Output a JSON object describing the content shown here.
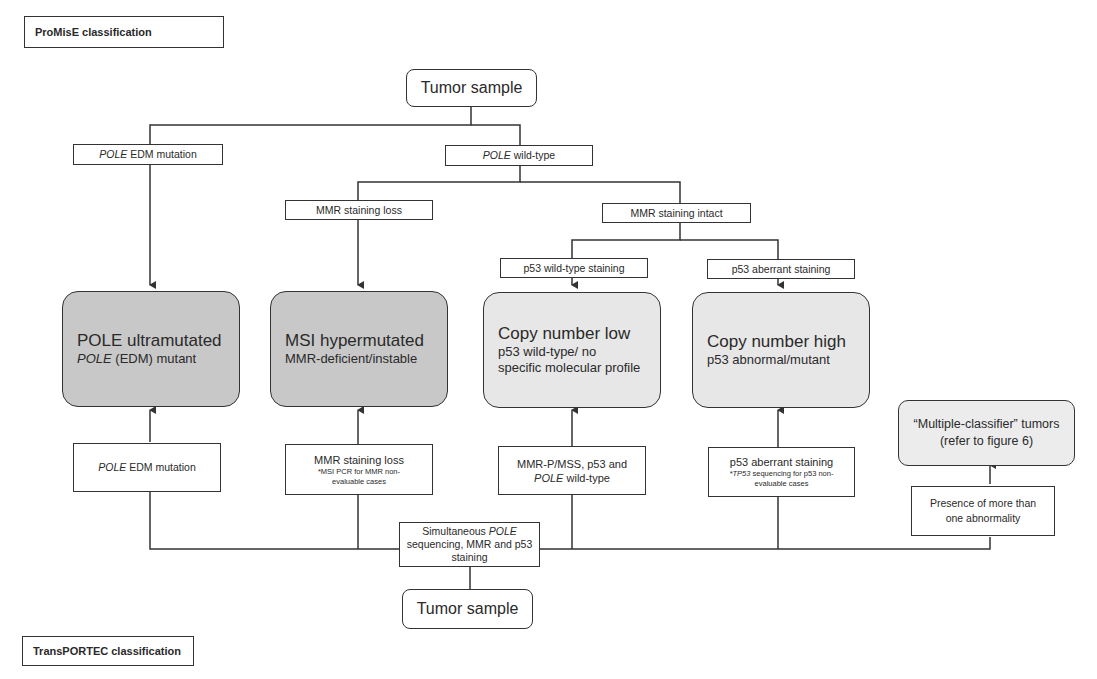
{
  "sections": {
    "top_title": "ProMisE classification",
    "bottom_title": "TransPORTEC classification"
  },
  "promise": {
    "root": "Tumor sample",
    "pole_mutation": {
      "italic": "POLE",
      "text": " EDM mutation"
    },
    "pole_wildtype": {
      "italic": "POLE",
      "text": " wild-type"
    },
    "mmr_loss": "MMR staining loss",
    "mmr_intact": "MMR staining intact",
    "p53_wildtype": "p53 wild-type staining",
    "p53_aberrant": "p53 aberrant staining"
  },
  "categories": [
    {
      "title": "POLE ultramutated",
      "subtitle_italic": "POLE",
      "subtitle": " (EDM) mutant",
      "fill": "#c8c8c8"
    },
    {
      "title": "MSI hypermutated",
      "subtitle_italic": "",
      "subtitle": "MMR-deficient/instable",
      "fill": "#c8c8c8"
    },
    {
      "title": "Copy number low",
      "subtitle_italic": "",
      "subtitle": "p53 wild-type/ no specific molecular profile",
      "fill": "#e7e7e7"
    },
    {
      "title": "Copy number high",
      "subtitle_italic": "",
      "subtitle": "p53 abnormal/mutant",
      "fill": "#e7e7e7"
    }
  ],
  "multiple_classifier": {
    "line1": "“Multiple-classifier” tumors",
    "line2": "(refer to figure 6)"
  },
  "transportec": {
    "root": "Tumor sample",
    "simultaneous": {
      "pre": "Simultaneous ",
      "italic": "POLE",
      "post": " sequencing, MMR and p53 staining"
    },
    "pole_mutation": {
      "italic": "POLE",
      "text": " EDM mutation"
    },
    "mmr_loss": {
      "main": "MMR staining loss",
      "note": "*MSI PCR for MMR non-evaluable cases"
    },
    "mmr_p": {
      "line1": "MMR-P/MSS, p53 and",
      "italic": "POLE",
      "line2": " wild-type"
    },
    "p53_aberrant": {
      "main": "p53 aberrant staining",
      "note_italic": "*TP53",
      "note": " sequencing for p53 non-evaluable cases"
    },
    "multiple": "Presence of more than one abnormality"
  },
  "colors": {
    "line": "#333333",
    "dark_category": "#c8c8c8",
    "light_category": "#e7e7e7",
    "multiple_fill": "#ececec"
  }
}
